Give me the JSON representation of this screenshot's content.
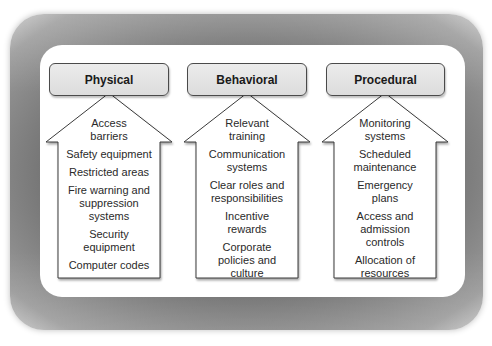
{
  "columns": [
    {
      "title": "Physical",
      "items": [
        "Access\nbarriers",
        "Safety equipment",
        "Restricted areas",
        "Fire warning and\nsuppression\nsystems",
        "Security\nequipment",
        "Computer codes"
      ]
    },
    {
      "title": "Behavioral",
      "items": [
        "Relevant\ntraining",
        "Communication\nsystems",
        "Clear roles and\nresponsibilities",
        "Incentive\nrewards",
        "Corporate\npolicies and\nculture"
      ]
    },
    {
      "title": "Procedural",
      "items": [
        "Monitoring\nsystems",
        "Scheduled\nmaintenance",
        "Emergency\nplans",
        "Access and\nadmission\ncontrols",
        "Allocation of\nresources"
      ]
    }
  ],
  "colors": {
    "frame": "#6e6e6e",
    "panel": "#ffffff",
    "header_fill": "#e2e2e2",
    "outline": "#3a3a3a",
    "text": "#2a2a2a"
  }
}
